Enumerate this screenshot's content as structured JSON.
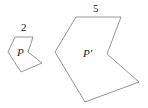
{
  "diagram": {
    "type": "similar-polygons",
    "stroke_color": "#8a8a8a",
    "text_color": "#222222",
    "shapes": [
      {
        "id": "small",
        "label": "P",
        "side_label": "2",
        "points": "15,37 33,37 28,52 42,63 21,72 8,52",
        "label_pos": {
          "x": 17,
          "y": 56
        },
        "side_label_pos": {
          "x": 21,
          "y": 31
        }
      },
      {
        "id": "large",
        "label": "P′",
        "side_label": "5",
        "points": "76,17 121,17 107,54 139,82 85,102 55,52",
        "label_pos": {
          "x": 83,
          "y": 57
        },
        "side_label_pos": {
          "x": 93,
          "y": 12
        }
      }
    ]
  }
}
